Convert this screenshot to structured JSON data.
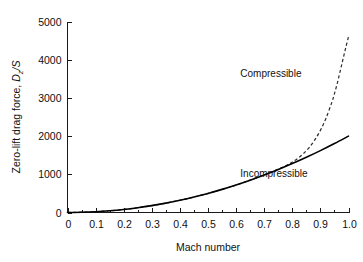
{
  "chart_data": {
    "type": "line",
    "title": "",
    "xlabel": "Mach number",
    "ylabel": "Zero-lift drag force, D_z/S",
    "ylabel_parts": {
      "prefix": "Zero-lift drag force, ",
      "symbol": "D",
      "subscript": "z",
      "suffix": "/S"
    },
    "xlim": [
      0,
      1.0
    ],
    "ylim": [
      0,
      5000
    ],
    "grid": false,
    "legend_position": "inline-annotation",
    "xticks": [
      0,
      0.1,
      0.2,
      0.3,
      0.4,
      0.5,
      0.6,
      0.7,
      0.8,
      0.9,
      1.0
    ],
    "xtick_labels": [
      "0",
      "0.1",
      "0.2",
      "0.3",
      "0.4",
      "0.5",
      "0.6",
      "0.7",
      "0.8",
      "0.9",
      "1.0"
    ],
    "x_minor_ticks": [
      0.05,
      0.15,
      0.25,
      0.35,
      0.45,
      0.55,
      0.65,
      0.75,
      0.85,
      0.95
    ],
    "yticks": [
      0,
      1000,
      2000,
      3000,
      4000,
      5000
    ],
    "ytick_labels": [
      "0",
      "1000",
      "2000",
      "3000",
      "4000",
      "5000"
    ],
    "series": [
      {
        "name": "Incompressible",
        "style": "solid",
        "color": "#000000",
        "annotation": "Incompressible",
        "x": [
          0.0,
          0.05,
          0.1,
          0.15,
          0.2,
          0.25,
          0.3,
          0.35,
          0.4,
          0.45,
          0.5,
          0.55,
          0.6,
          0.65,
          0.7,
          0.75,
          0.8,
          0.85,
          0.9,
          0.95,
          1.0
        ],
        "values": [
          0,
          5,
          20,
          45,
          80,
          125,
          180,
          245,
          320,
          405,
          500,
          605,
          720,
          845,
          980,
          1125,
          1280,
          1445,
          1620,
          1805,
          2000
        ]
      },
      {
        "name": "Compressible",
        "style": "dashed",
        "color": "#2b2b2b",
        "annotation": "Compressible",
        "x": [
          0.0,
          0.1,
          0.2,
          0.3,
          0.4,
          0.5,
          0.6,
          0.7,
          0.75,
          0.78,
          0.8,
          0.82,
          0.84,
          0.86,
          0.88,
          0.9,
          0.92,
          0.94,
          0.95,
          0.96,
          0.97,
          0.98,
          0.99,
          1.0
        ],
        "values": [
          0,
          20,
          80,
          180,
          320,
          500,
          720,
          985,
          1135,
          1235,
          1320,
          1420,
          1545,
          1700,
          1900,
          2150,
          2470,
          2870,
          3110,
          3380,
          3690,
          4000,
          4310,
          4600
        ]
      }
    ],
    "annotations": [
      {
        "text": "Compressible",
        "x": 0.615,
        "y": 3550
      },
      {
        "text": "Incompressible",
        "x": 0.615,
        "y": 930
      }
    ]
  }
}
